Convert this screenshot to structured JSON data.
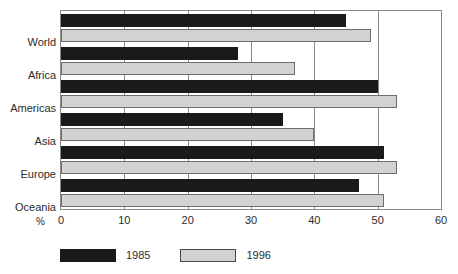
{
  "chart_data": {
    "type": "bar",
    "orientation": "horizontal",
    "title": "",
    "subtitle": "",
    "xlabel": "%",
    "ylabel": "",
    "xlim": [
      0,
      60
    ],
    "xticks": [
      0,
      10,
      20,
      30,
      40,
      50,
      60
    ],
    "xtick_labels": [
      "0",
      "10",
      "20",
      "30",
      "40",
      "50",
      "60"
    ],
    "grid": "vertical",
    "legend_position": "bottom-left",
    "categories": [
      "World",
      "Africa",
      "Americas",
      "Asia",
      "Europe",
      "Oceania"
    ],
    "series": [
      {
        "name": "1985",
        "color": "#1a1a1a",
        "values": [
          45,
          28,
          50,
          35,
          51,
          47
        ]
      },
      {
        "name": "1996",
        "color": "#d2d2d2",
        "values": [
          49,
          37,
          53,
          40,
          53,
          51
        ]
      }
    ]
  },
  "axis": {
    "unit_symbol": "%"
  },
  "legend": {
    "items": [
      {
        "label": "1985",
        "swatch": "black-filled-swatch"
      },
      {
        "label": "1996",
        "swatch": "grey-filled-swatch"
      }
    ]
  }
}
